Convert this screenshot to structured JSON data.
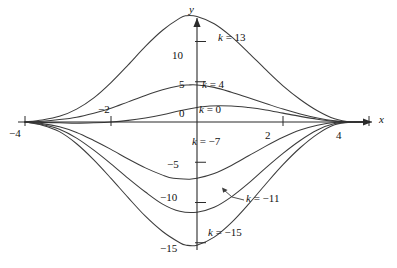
{
  "figure": {
    "background": "#ffffff",
    "line_color": "#3c3c3c",
    "axis_color": "#2b2b2b"
  },
  "axes": {
    "x_name": "x",
    "y_name": "y",
    "x_ticks": [
      {
        "value": -4,
        "label": "−4"
      },
      {
        "value": -2,
        "label": "−2"
      },
      {
        "value": 2,
        "label": "2"
      },
      {
        "value": 4,
        "label": "4"
      }
    ],
    "y_ticks": [
      {
        "value": 10,
        "label": "10"
      },
      {
        "value": 5,
        "label": "5"
      },
      {
        "value": 0,
        "label": "0"
      },
      {
        "value": -5,
        "label": "−5"
      },
      {
        "value": -10,
        "label": "−10"
      },
      {
        "value": -15,
        "label": "−15"
      }
    ]
  },
  "curve_labels": [
    {
      "text_k": "k",
      "text_rest": " = 13"
    },
    {
      "text_k": "k",
      "text_rest": " = 4"
    },
    {
      "text_k": "k",
      "text_rest": " = 0"
    },
    {
      "text_k": "k",
      "text_rest": " = −7"
    },
    {
      "text_k": "k",
      "text_rest": " = −11"
    },
    {
      "text_k": "k",
      "text_rest": " = −15"
    }
  ],
  "chart_data": {
    "type": "line",
    "title": "",
    "xlabel": "x",
    "ylabel": "y",
    "xlim": [
      -4.4,
      4.2
    ],
    "ylim": [
      -16.5,
      14.5
    ],
    "grid": false,
    "legend": "inline-curve-labels",
    "series": [
      {
        "name": "k = 13",
        "k": 13,
        "peak": {
          "x": -0.25,
          "y": 13.2
        },
        "points": [
          [
            -4.0,
            0.0
          ],
          [
            -3.6,
            0.25
          ],
          [
            -3.2,
            0.7
          ],
          [
            -2.8,
            1.6
          ],
          [
            -2.4,
            3.0
          ],
          [
            -2.0,
            4.9
          ],
          [
            -1.6,
            7.1
          ],
          [
            -1.2,
            9.4
          ],
          [
            -0.8,
            11.4
          ],
          [
            -0.4,
            12.9
          ],
          [
            -0.25,
            13.2
          ],
          [
            0.0,
            13.1
          ],
          [
            0.4,
            12.2
          ],
          [
            0.8,
            10.6
          ],
          [
            1.2,
            8.6
          ],
          [
            1.6,
            6.5
          ],
          [
            2.0,
            4.5
          ],
          [
            2.4,
            2.8
          ],
          [
            2.8,
            1.4
          ],
          [
            3.2,
            0.4
          ],
          [
            3.6,
            0.0
          ],
          [
            4.0,
            0.0
          ]
        ]
      },
      {
        "name": "k = 4",
        "k": 4,
        "peak": {
          "x": -0.2,
          "y": 4.6
        },
        "points": [
          [
            -4.0,
            0.0
          ],
          [
            -3.6,
            0.1
          ],
          [
            -3.2,
            0.3
          ],
          [
            -2.8,
            0.6
          ],
          [
            -2.4,
            1.1
          ],
          [
            -2.0,
            1.7
          ],
          [
            -1.6,
            2.5
          ],
          [
            -1.2,
            3.3
          ],
          [
            -0.8,
            4.0
          ],
          [
            -0.4,
            4.5
          ],
          [
            -0.2,
            4.6
          ],
          [
            0.0,
            4.6
          ],
          [
            0.4,
            4.3
          ],
          [
            0.8,
            3.7
          ],
          [
            1.2,
            3.0
          ],
          [
            1.6,
            2.3
          ],
          [
            2.0,
            1.6
          ],
          [
            2.4,
            1.0
          ],
          [
            2.8,
            0.5
          ],
          [
            3.2,
            0.15
          ],
          [
            3.6,
            0.0
          ],
          [
            4.0,
            0.0
          ]
        ]
      },
      {
        "name": "k = 0",
        "k": 0,
        "peak": {
          "x": 0.3,
          "y": 2.0
        },
        "points": [
          [
            -4.0,
            0.0
          ],
          [
            -3.6,
            -0.05
          ],
          [
            -3.2,
            -0.1
          ],
          [
            -2.8,
            -0.15
          ],
          [
            -2.4,
            -0.1
          ],
          [
            -2.0,
            0.0
          ],
          [
            -1.6,
            0.2
          ],
          [
            -1.2,
            0.5
          ],
          [
            -0.8,
            0.9
          ],
          [
            -0.4,
            1.4
          ],
          [
            0.0,
            1.8
          ],
          [
            0.3,
            2.0
          ],
          [
            0.8,
            2.0
          ],
          [
            1.2,
            1.8
          ],
          [
            1.6,
            1.5
          ],
          [
            2.0,
            1.1
          ],
          [
            2.4,
            0.7
          ],
          [
            2.8,
            0.35
          ],
          [
            3.2,
            0.1
          ],
          [
            3.6,
            0.0
          ],
          [
            4.0,
            0.0
          ]
        ]
      },
      {
        "name": "k = -7",
        "k": -7,
        "minimum": {
          "x": -0.55,
          "y": -7.1
        },
        "points": [
          [
            -4.0,
            0.0
          ],
          [
            -3.6,
            -0.2
          ],
          [
            -3.2,
            -0.6
          ],
          [
            -2.8,
            -1.3
          ],
          [
            -2.4,
            -2.3
          ],
          [
            -2.0,
            -3.4
          ],
          [
            -1.6,
            -4.6
          ],
          [
            -1.2,
            -5.7
          ],
          [
            -0.8,
            -6.6
          ],
          [
            -0.55,
            -7.0
          ],
          [
            -0.2,
            -7.1
          ],
          [
            0.0,
            -7.0
          ],
          [
            0.4,
            -6.4
          ],
          [
            0.8,
            -5.4
          ],
          [
            1.2,
            -4.2
          ],
          [
            1.6,
            -3.0
          ],
          [
            2.0,
            -1.9
          ],
          [
            2.4,
            -1.0
          ],
          [
            2.8,
            -0.4
          ],
          [
            3.2,
            -0.05
          ],
          [
            3.6,
            0.0
          ],
          [
            4.0,
            0.0
          ]
        ]
      },
      {
        "name": "k = -11",
        "k": -11,
        "minimum": {
          "x": -0.4,
          "y": -11.2
        },
        "points": [
          [
            -4.0,
            0.0
          ],
          [
            -3.6,
            -0.3
          ],
          [
            -3.2,
            -0.9
          ],
          [
            -2.8,
            -2.0
          ],
          [
            -2.4,
            -3.5
          ],
          [
            -2.0,
            -5.2
          ],
          [
            -1.6,
            -7.0
          ],
          [
            -1.2,
            -8.7
          ],
          [
            -0.8,
            -10.2
          ],
          [
            -0.4,
            -11.1
          ],
          [
            0.0,
            -11.2
          ],
          [
            0.4,
            -10.6
          ],
          [
            0.8,
            -9.3
          ],
          [
            1.2,
            -7.6
          ],
          [
            1.6,
            -5.7
          ],
          [
            2.0,
            -3.9
          ],
          [
            2.4,
            -2.3
          ],
          [
            2.8,
            -1.0
          ],
          [
            3.2,
            -0.2
          ],
          [
            3.6,
            0.0
          ],
          [
            4.0,
            0.0
          ]
        ]
      },
      {
        "name": "k = -15",
        "k": -15,
        "minimum": {
          "x": -0.25,
          "y": -15.3
        },
        "points": [
          [
            -4.0,
            0.0
          ],
          [
            -3.6,
            -0.4
          ],
          [
            -3.2,
            -1.2
          ],
          [
            -2.8,
            -2.7
          ],
          [
            -2.4,
            -4.7
          ],
          [
            -2.0,
            -7.0
          ],
          [
            -1.6,
            -9.4
          ],
          [
            -1.2,
            -11.7
          ],
          [
            -0.8,
            -13.6
          ],
          [
            -0.4,
            -15.0
          ],
          [
            -0.25,
            -15.3
          ],
          [
            0.0,
            -15.3
          ],
          [
            0.4,
            -14.3
          ],
          [
            0.8,
            -12.5
          ],
          [
            1.2,
            -10.2
          ],
          [
            1.6,
            -7.7
          ],
          [
            2.0,
            -5.3
          ],
          [
            2.4,
            -3.2
          ],
          [
            2.8,
            -1.5
          ],
          [
            3.2,
            -0.35
          ],
          [
            3.6,
            0.0
          ],
          [
            4.0,
            0.0
          ]
        ]
      }
    ]
  }
}
